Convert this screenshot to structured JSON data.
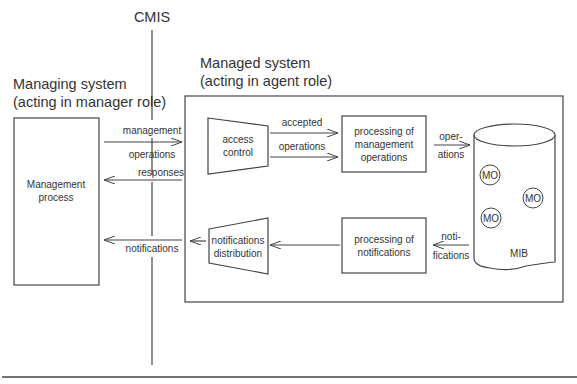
{
  "cmis_label": "CMIS",
  "managing": {
    "title_line1": "Managing system",
    "title_line2": "(acting in manager role)",
    "process_line1": "Management",
    "process_line2": "process"
  },
  "managed": {
    "title_line1": "Managed system",
    "title_line2": "(acting in agent role)"
  },
  "flows": {
    "management": "management",
    "operations": "operations",
    "responses": "responses",
    "notifications": "notifications",
    "accepted": "accepted",
    "operations_inner": "operations",
    "oper_line1": "oper-",
    "oper_line2": "ations",
    "noti_line1": "noti-",
    "noti_line2": "fications"
  },
  "blocks": {
    "access_control_line1": "access",
    "access_control_line2": "control",
    "proc_mgmt_line1": "processing of",
    "proc_mgmt_line2": "management",
    "proc_mgmt_line3": "operations",
    "proc_notif_line1": "processing of",
    "proc_notif_line2": "notifications",
    "notif_dist_line1": "notifications",
    "notif_dist_line2": "distribution"
  },
  "mib": {
    "label": "MIB",
    "objects": [
      "MO",
      "MO",
      "MO"
    ]
  }
}
